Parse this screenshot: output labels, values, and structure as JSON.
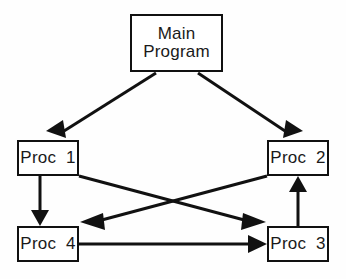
{
  "diagram": {
    "type": "structure-chart",
    "background_color": "#fefefe",
    "line_color": "#111111",
    "text_color": "#1a1a1a",
    "canvas": {
      "width": 346,
      "height": 279
    },
    "nodes": [
      {
        "id": "main",
        "label_line1": "Main",
        "label_line2": "Program",
        "x": 130,
        "y": 14,
        "width": 93,
        "height": 58
      },
      {
        "id": "proc1",
        "label": "Proc  1",
        "x": 17,
        "y": 140,
        "width": 62,
        "height": 36
      },
      {
        "id": "proc2",
        "label": "Proc  2",
        "x": 267,
        "y": 140,
        "width": 62,
        "height": 36
      },
      {
        "id": "proc4",
        "label": "Proc  4",
        "x": 17,
        "y": 226,
        "width": 62,
        "height": 36
      },
      {
        "id": "proc3",
        "label": "Proc  3",
        "x": 267,
        "y": 226,
        "width": 62,
        "height": 36
      }
    ],
    "edges": [
      {
        "id": "main-to-proc1",
        "from": "main",
        "to": "proc1",
        "style": "diagonal-down-left",
        "arrowhead": "filled-triangle"
      },
      {
        "id": "main-to-proc2",
        "from": "main",
        "to": "proc2",
        "style": "diagonal-down-right",
        "arrowhead": "filled-triangle"
      },
      {
        "id": "proc1-to-proc4",
        "from": "proc1",
        "to": "proc4",
        "style": "vertical-down",
        "arrowhead": "filled-triangle"
      },
      {
        "id": "proc1-to-proc3",
        "from": "proc1",
        "to": "proc3",
        "style": "diagonal-cross-down-right",
        "arrowhead": "filled-triangle"
      },
      {
        "id": "proc2-to-proc4",
        "from": "proc2",
        "to": "proc4",
        "style": "diagonal-cross-down-left",
        "arrowhead": "filled-triangle"
      },
      {
        "id": "proc4-to-proc3",
        "from": "proc4",
        "to": "proc3",
        "style": "horizontal-right",
        "arrowhead": "filled-triangle"
      },
      {
        "id": "proc3-to-proc2",
        "from": "proc3",
        "to": "proc2",
        "style": "vertical-up",
        "arrowhead": "filled-triangle"
      }
    ]
  }
}
